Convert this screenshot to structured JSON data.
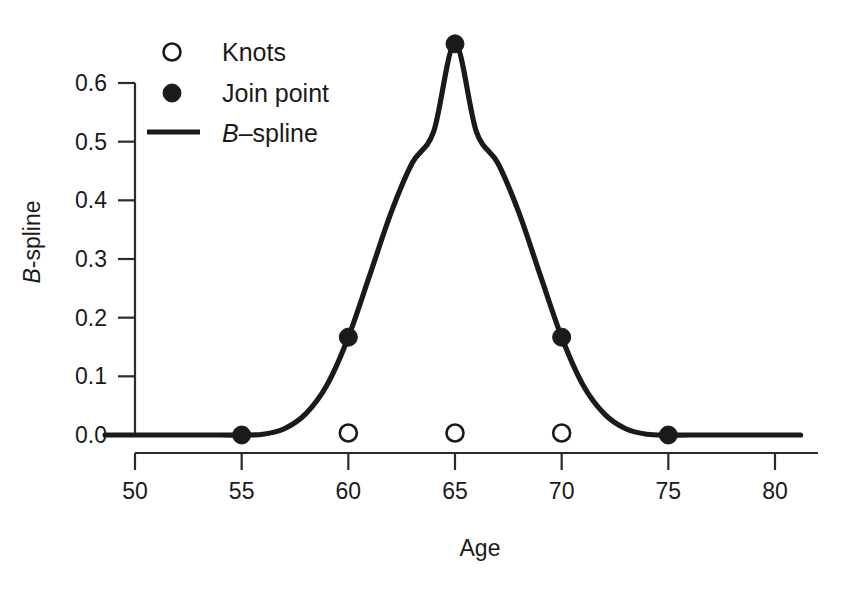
{
  "chart_data": {
    "type": "line",
    "title": "",
    "xlabel": "Age",
    "ylabel": "B-spline",
    "ylabel_italic_prefix": "B",
    "ylabel_rest": "-spline",
    "xlim": [
      48.6,
      81.2
    ],
    "ylim": [
      -0.022,
      0.7
    ],
    "xticks": [
      50,
      55,
      60,
      65,
      70,
      75,
      80
    ],
    "xtick_labels": [
      "50",
      "55",
      "60",
      "65",
      "70",
      "75",
      "80"
    ],
    "yticks": [
      0.0,
      0.1,
      0.2,
      0.3,
      0.4,
      0.5,
      0.6
    ],
    "ytick_labels": [
      "0.0",
      "0.1",
      "0.2",
      "0.3",
      "0.4",
      "0.5",
      "0.6"
    ],
    "grid": false,
    "legend_position": "top-left",
    "series": [
      {
        "name": "B-spline",
        "marker": "line",
        "color": "#1a1a1a",
        "description": "Cubic B-spline basis function with knots at 55, 60, 65, 70, 75",
        "x": [
          48.6,
          50.0,
          52.0,
          54.0,
          55.0,
          56.0,
          57.0,
          58.0,
          59.0,
          60.0,
          61.0,
          62.0,
          63.0,
          64.0,
          65.0,
          66.0,
          67.0,
          68.0,
          69.0,
          70.0,
          71.0,
          72.0,
          73.0,
          74.0,
          75.0,
          76.0,
          78.0,
          81.2
        ],
        "y": [
          0.0,
          0.0,
          0.0,
          0.0,
          0.0,
          0.0013,
          0.0107,
          0.036,
          0.0853,
          0.1667,
          0.272,
          0.3787,
          0.464,
          0.5173,
          0.6667,
          0.5173,
          0.464,
          0.3787,
          0.272,
          0.1667,
          0.0853,
          0.036,
          0.0107,
          0.0013,
          0.0,
          0.0,
          0.0,
          0.0
        ]
      },
      {
        "name": "Join point",
        "marker": "filled-circle",
        "color": "#1a1a1a",
        "x": [
          55,
          60,
          65,
          70,
          75
        ],
        "y": [
          0.0,
          0.1667,
          0.6667,
          0.1667,
          0.0
        ]
      },
      {
        "name": "Knots",
        "marker": "open-circle",
        "color": "#1a1a1a",
        "x": [
          60,
          65,
          70
        ],
        "y": [
          0.0,
          0.0,
          0.0
        ]
      }
    ],
    "legend_entries": [
      {
        "label": "Knots",
        "marker": "open-circle"
      },
      {
        "label": "Join point",
        "marker": "filled-circle"
      },
      {
        "label": "B-spline",
        "marker": "line",
        "italic_prefix": "B",
        "rest": "–spline"
      }
    ],
    "colors": {
      "curve": "#1a1a1a",
      "axis": "#2b2b2b",
      "background": "#ffffff"
    }
  }
}
